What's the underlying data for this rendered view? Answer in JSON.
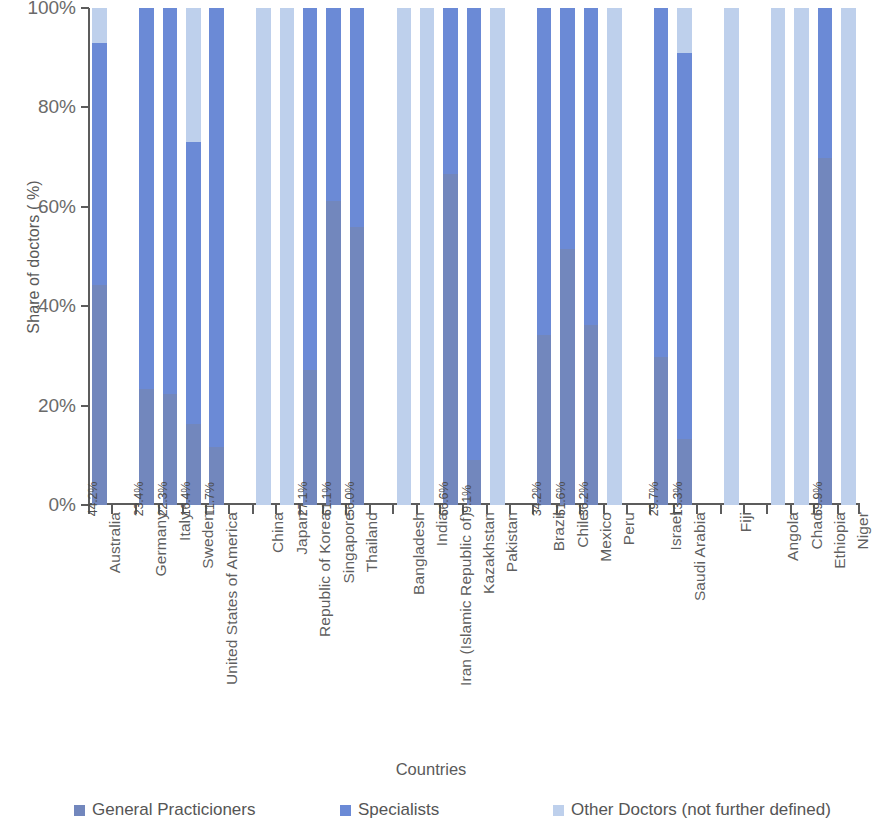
{
  "chart_data": {
    "type": "bar",
    "subtype": "stacked-100-percent",
    "title": "",
    "xlabel": "Countries",
    "ylabel": "Share of doctors ( %)",
    "ylim": [
      0,
      100
    ],
    "ytick_labels": [
      "0%",
      "20%",
      "40%",
      "60%",
      "80%",
      "100%"
    ],
    "ytick_values": [
      0,
      20,
      40,
      60,
      80,
      100
    ],
    "grid": false,
    "legend_position": "bottom",
    "colors": {
      "general_practicioners": "#7287bd",
      "specialists": "#6b8ad6",
      "other_doctors": "#bed0ec",
      "axis": "#5c5c5c",
      "text": "#5f5f5f"
    },
    "legend": [
      "General Practicioners",
      "Specialists",
      "Other Doctors (not further defined)"
    ],
    "series": [
      {
        "name": "General Practicioners",
        "values": [
          44.2,
          null,
          23.4,
          22.3,
          16.4,
          11.7,
          null,
          0,
          0,
          27.1,
          61.1,
          56.0,
          null,
          0,
          0,
          66.6,
          9.1,
          0,
          null,
          34.2,
          51.6,
          36.2,
          0,
          null,
          29.7,
          13.3,
          null,
          0,
          null,
          0,
          0,
          69.9,
          0
        ]
      },
      {
        "name": "Specialists",
        "values": [
          48.8,
          null,
          76.6,
          77.7,
          56.6,
          88.3,
          null,
          0,
          0,
          72.9,
          38.9,
          44.0,
          null,
          0,
          0,
          33.4,
          90.9,
          0,
          null,
          65.8,
          48.4,
          63.8,
          0,
          null,
          70.3,
          77.7,
          null,
          0,
          null,
          0,
          0,
          30.1,
          0
        ]
      },
      {
        "name": "Other Doctors (not further defined)",
        "values": [
          7.0,
          null,
          0,
          0,
          27.0,
          0,
          null,
          100,
          100,
          0,
          0,
          0,
          null,
          100,
          100,
          0,
          0,
          100,
          null,
          0,
          0,
          0,
          100,
          null,
          0,
          9.0,
          null,
          100,
          null,
          100,
          100,
          0,
          100
        ]
      }
    ],
    "categories": [
      "Australia",
      "",
      "Germany",
      "Italy",
      "Sweden",
      "United States of America",
      "",
      "China",
      "Japan",
      "Republic of Korea",
      "Singapore",
      "Thailand",
      "",
      "Bangladesh",
      "India",
      "Iran (Islamic Republic of)",
      "Kazakhstan",
      "Pakistan",
      "",
      "Brazil",
      "Chile",
      "Mexico",
      "Peru",
      "",
      "Israel",
      "Saudi Arabia",
      "",
      "Fiji",
      "",
      "Angola",
      "Chad",
      "Ethiopia",
      "Niger"
    ],
    "bars": [
      {
        "country": "Australia",
        "gp": 44.2,
        "sp": 48.8,
        "ot": 7.0,
        "label": "44.2%"
      },
      {
        "country": "",
        "gp": null,
        "sp": null,
        "ot": null,
        "label": ""
      },
      {
        "country": "Germany",
        "gp": 23.4,
        "sp": 76.6,
        "ot": 0.0,
        "label": "23.4%"
      },
      {
        "country": "Italy",
        "gp": 22.3,
        "sp": 77.7,
        "ot": 0.0,
        "label": "22.3%"
      },
      {
        "country": "Sweden",
        "gp": 16.4,
        "sp": 56.6,
        "ot": 27.0,
        "label": "16.4%"
      },
      {
        "country": "United States of America",
        "gp": 11.7,
        "sp": 88.3,
        "ot": 0.0,
        "label": "11.7%"
      },
      {
        "country": "",
        "gp": null,
        "sp": null,
        "ot": null,
        "label": ""
      },
      {
        "country": "China",
        "gp": 0.0,
        "sp": 0.0,
        "ot": 100.0,
        "label": ""
      },
      {
        "country": "Japan",
        "gp": 0.0,
        "sp": 0.0,
        "ot": 100.0,
        "label": ""
      },
      {
        "country": "Republic of Korea",
        "gp": 27.1,
        "sp": 72.9,
        "ot": 0.0,
        "label": "27.1%"
      },
      {
        "country": "Singapore",
        "gp": 61.1,
        "sp": 38.9,
        "ot": 0.0,
        "label": "61.1%"
      },
      {
        "country": "Thailand",
        "gp": 56.0,
        "sp": 44.0,
        "ot": 0.0,
        "label": "56.0%"
      },
      {
        "country": "",
        "gp": null,
        "sp": null,
        "ot": null,
        "label": ""
      },
      {
        "country": "Bangladesh",
        "gp": 0.0,
        "sp": 0.0,
        "ot": 100.0,
        "label": ""
      },
      {
        "country": "India",
        "gp": 0.0,
        "sp": 0.0,
        "ot": 100.0,
        "label": ""
      },
      {
        "country": "Iran (Islamic Republic of)",
        "gp": 66.6,
        "sp": 33.4,
        "ot": 0.0,
        "label": "66.6%"
      },
      {
        "country": "Kazakhstan",
        "gp": 9.1,
        "sp": 90.9,
        "ot": 0.0,
        "label": "9.1%"
      },
      {
        "country": "Pakistan",
        "gp": 0.0,
        "sp": 0.0,
        "ot": 100.0,
        "label": ""
      },
      {
        "country": "",
        "gp": null,
        "sp": null,
        "ot": null,
        "label": ""
      },
      {
        "country": "Brazil",
        "gp": 34.2,
        "sp": 65.8,
        "ot": 0.0,
        "label": "34.2%"
      },
      {
        "country": "Chile",
        "gp": 51.6,
        "sp": 48.4,
        "ot": 0.0,
        "label": "51.6%"
      },
      {
        "country": "Mexico",
        "gp": 36.2,
        "sp": 63.8,
        "ot": 0.0,
        "label": "36.2%"
      },
      {
        "country": "Peru",
        "gp": 0.0,
        "sp": 0.0,
        "ot": 100.0,
        "label": ""
      },
      {
        "country": "",
        "gp": null,
        "sp": null,
        "ot": null,
        "label": ""
      },
      {
        "country": "Israel",
        "gp": 29.7,
        "sp": 70.3,
        "ot": 0.0,
        "label": "29.7%"
      },
      {
        "country": "Saudi Arabia",
        "gp": 13.3,
        "sp": 77.7,
        "ot": 9.0,
        "label": "13.3%"
      },
      {
        "country": "",
        "gp": null,
        "sp": null,
        "ot": null,
        "label": ""
      },
      {
        "country": "Fiji",
        "gp": 0.0,
        "sp": 0.0,
        "ot": 100.0,
        "label": ""
      },
      {
        "country": "",
        "gp": null,
        "sp": null,
        "ot": null,
        "label": ""
      },
      {
        "country": "Angola",
        "gp": 0.0,
        "sp": 0.0,
        "ot": 100.0,
        "label": ""
      },
      {
        "country": "Chad",
        "gp": 0.0,
        "sp": 0.0,
        "ot": 100.0,
        "label": ""
      },
      {
        "country": "Ethiopia",
        "gp": 69.9,
        "sp": 30.1,
        "ot": 0.0,
        "label": "69.9%"
      },
      {
        "country": "Niger",
        "gp": 0.0,
        "sp": 0.0,
        "ot": 100.0,
        "label": ""
      }
    ]
  }
}
